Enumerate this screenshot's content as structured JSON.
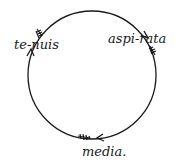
{
  "diagram": {
    "type": "cycle",
    "nodes": [
      {
        "id": "tenuis",
        "label": "te-nuis"
      },
      {
        "id": "aspirata",
        "label": "aspi-rata"
      },
      {
        "id": "media",
        "label": "media."
      }
    ],
    "edges": [
      {
        "from": "tenuis",
        "to": "aspirata",
        "direction": "clockwise"
      },
      {
        "from": "aspirata",
        "to": "media",
        "direction": "clockwise"
      },
      {
        "from": "media",
        "to": "tenuis",
        "direction": "clockwise"
      }
    ],
    "colors": {
      "stroke": "#1a1a1a",
      "background": "#ffffff"
    }
  }
}
